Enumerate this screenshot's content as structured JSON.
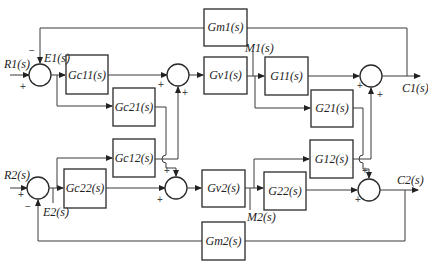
{
  "diagram": {
    "type": "MIMO feedback control block diagram",
    "blocks": {
      "gm1": "Gm1(s)",
      "gc11": "Gc11(s)",
      "gc21": "Gc21(s)",
      "gv1": "Gv1(s)",
      "g11": "G11(s)",
      "g21": "G21(s)",
      "gc12": "Gc12(s)",
      "gc22": "Gc22(s)",
      "gv2": "Gv2(s)",
      "g12": "G12(s)",
      "g22": "G22(s)",
      "gm2": "Gm2(s)"
    },
    "signals": {
      "r1": "R1(s)",
      "e1": "E1(s)",
      "m1": "M1(s)",
      "c1": "C1(s)",
      "r2": "R2(s)",
      "e2": "E2(s)",
      "m2": "M2(s)",
      "c2": "C2(s)"
    },
    "signs": {
      "plus": "+",
      "minus": "−"
    }
  }
}
